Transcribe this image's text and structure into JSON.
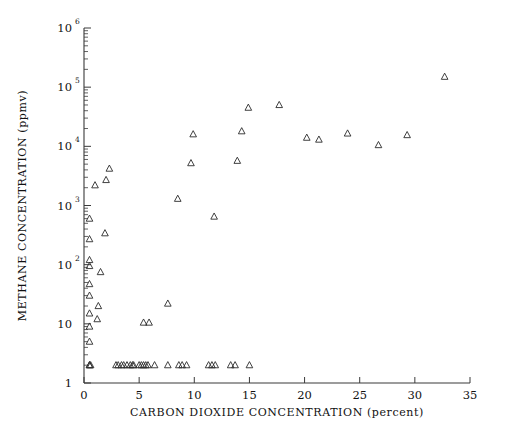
{
  "chart_data": {
    "type": "scatter",
    "title": "",
    "xlabel": "CARBON DIOXIDE CONCENTRATION (percent)",
    "ylabel": "METHANE CONCENTRATION (ppmv)",
    "xlim": [
      0,
      35
    ],
    "ylim": [
      1,
      1000000
    ],
    "yscale": "log",
    "xscale": "linear",
    "grid": false,
    "legend": null,
    "marker": "open-triangle",
    "marker_color": "#2b2b2b",
    "xticks": [
      0,
      5,
      10,
      15,
      20,
      25,
      30,
      35
    ],
    "xtick_labels": [
      "0",
      "5",
      "10",
      "15",
      "20",
      "25",
      "30",
      "35"
    ],
    "yticks": [
      1,
      10,
      100,
      1000,
      10000,
      100000,
      1000000
    ],
    "ytick_labels": [
      "1",
      "10",
      "10 2",
      "10 3",
      "10 4",
      "10 5",
      "10 6"
    ],
    "ytick_mantissa": [
      "1",
      "10",
      "10",
      "10",
      "10",
      "10",
      "10"
    ],
    "ytick_exponent": [
      "",
      "",
      "2",
      "3",
      "4",
      "5",
      "6"
    ],
    "points": [
      [
        0.5,
        2.0
      ],
      [
        0.5,
        2.0
      ],
      [
        0.6,
        2.0
      ],
      [
        2.9,
        2.0
      ],
      [
        3.1,
        2.0
      ],
      [
        3.4,
        2.0
      ],
      [
        3.6,
        2.0
      ],
      [
        3.9,
        2.0
      ],
      [
        4.2,
        2.0
      ],
      [
        4.4,
        2.0
      ],
      [
        4.5,
        2.0
      ],
      [
        5.0,
        2.0
      ],
      [
        5.2,
        2.0
      ],
      [
        5.4,
        2.0
      ],
      [
        5.6,
        2.0
      ],
      [
        5.8,
        2.0
      ],
      [
        6.4,
        2.0
      ],
      [
        7.6,
        2.0
      ],
      [
        8.6,
        2.0
      ],
      [
        8.9,
        2.0
      ],
      [
        9.3,
        2.0
      ],
      [
        11.3,
        2.0
      ],
      [
        11.6,
        2.0
      ],
      [
        11.9,
        2.0
      ],
      [
        13.3,
        2.0
      ],
      [
        13.7,
        2.0
      ],
      [
        15.0,
        2.0
      ],
      [
        0.5,
        5.0
      ],
      [
        0.5,
        9.0
      ],
      [
        0.5,
        15.0
      ],
      [
        0.5,
        30.0
      ],
      [
        0.5,
        47.0
      ],
      [
        0.5,
        95.0
      ],
      [
        0.5,
        120.0
      ],
      [
        0.5,
        270.0
      ],
      [
        0.5,
        600.0
      ],
      [
        1.0,
        2200.0
      ],
      [
        2.0,
        2700.0
      ],
      [
        2.3,
        4200.0
      ],
      [
        1.2,
        12.0
      ],
      [
        1.3,
        20.0
      ],
      [
        1.5,
        75.0
      ],
      [
        1.9,
        340.0
      ],
      [
        5.4,
        10.5
      ],
      [
        5.9,
        10.5
      ],
      [
        7.6,
        22.0
      ],
      [
        8.5,
        1300.0
      ],
      [
        9.7,
        5200.0
      ],
      [
        9.9,
        16000.0
      ],
      [
        11.8,
        650.0
      ],
      [
        13.9,
        5700.0
      ],
      [
        14.3,
        18000.0
      ],
      [
        14.9,
        45000.0
      ],
      [
        17.7,
        50000.0
      ],
      [
        20.2,
        14000.0
      ],
      [
        21.3,
        13000.0
      ],
      [
        23.9,
        16500.0
      ],
      [
        26.7,
        10500.0
      ],
      [
        29.3,
        15500.0
      ],
      [
        32.7,
        150000.0
      ]
    ]
  }
}
